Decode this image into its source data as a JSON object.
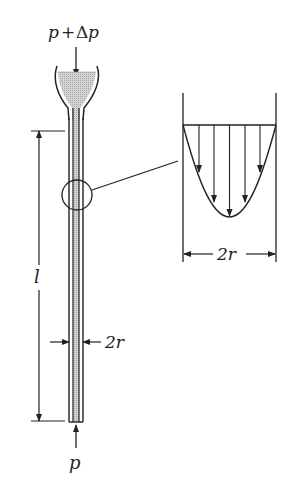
{
  "diagram": {
    "labels": {
      "top_pressure_p": "p",
      "top_pressure_plus": "+",
      "top_pressure_delta": "Δ",
      "top_pressure_p2": "p",
      "bottom_pressure": "p",
      "length": "l",
      "tube_diameter": "2r",
      "profile_diameter": "2r"
    },
    "colors": {
      "line": "#222222",
      "fluid_fill": "#c8c8c8",
      "background": "#ffffff"
    },
    "profile": {
      "shape": "parabolic",
      "arrow_count": 5
    }
  }
}
